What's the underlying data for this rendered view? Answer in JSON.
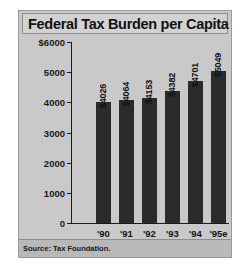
{
  "panel": {
    "title": "Federal Tax Burden per Capita",
    "source": "Source: Tax Foundation."
  },
  "chart_data": {
    "type": "bar",
    "title": "Federal Tax Burden per Capita",
    "categories": [
      "'90",
      "'91",
      "'92",
      "'93",
      "'94",
      "'95e"
    ],
    "values": [
      4026,
      4064,
      4153,
      4382,
      4701,
      5049
    ],
    "value_labels": [
      "$4026",
      "$4064",
      "$4153",
      "$4382",
      "$4701",
      "$5049"
    ],
    "xlabel": "",
    "ylabel": "",
    "ylim": [
      0,
      6000
    ],
    "yticks": [
      0,
      1000,
      2000,
      3000,
      4000,
      5000,
      6000
    ],
    "ytick_labels": [
      "0",
      "1000",
      "2000",
      "3000",
      "4000",
      "5000",
      "$6000"
    ],
    "grid": false,
    "legend": null,
    "bar_color": "#2b2b2b",
    "background_color": "#c9c9c9",
    "annotation": "Source: Tax Foundation."
  }
}
